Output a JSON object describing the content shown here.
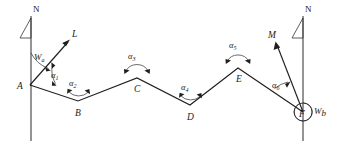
{
  "figure": {
    "background_color": "#ffffff",
    "line_color": "#1f1f1f",
    "width": 345,
    "height": 145
  },
  "north_markers": [
    {
      "id": "north-left",
      "label": "N",
      "x": 33,
      "y": 8
    },
    {
      "id": "north-right",
      "label": "N",
      "x": 305,
      "y": 8
    }
  ],
  "meridians": [
    {
      "id": "meridian-left",
      "x": 31,
      "y_top": 16,
      "y_bottom": 141
    },
    {
      "id": "meridian-right",
      "x": 303,
      "y_top": 16,
      "y_bottom": 141
    }
  ],
  "stations": [
    {
      "id": "A",
      "label": "A",
      "x": 30,
      "y": 85,
      "label_x": 17,
      "label_y": 88
    },
    {
      "id": "B",
      "label": "B",
      "x": 78,
      "y": 101,
      "label_x": 75,
      "label_y": 114
    },
    {
      "id": "C",
      "label": "C",
      "x": 137,
      "y": 78,
      "label_x": 134,
      "label_y": 91
    },
    {
      "id": "D",
      "label": "D",
      "x": 190,
      "y": 105,
      "label_x": 187,
      "label_y": 118
    },
    {
      "id": "E",
      "label": "E",
      "x": 238,
      "y": 68,
      "label_x": 236,
      "label_y": 81
    },
    {
      "id": "F",
      "label": "F",
      "x": 303,
      "y": 112,
      "label_x": 299,
      "label_y": 118
    }
  ],
  "traverse_path": "A-B-C-D-E-F",
  "angles": [
    {
      "id": "alpha-1",
      "label": "α",
      "sub": "1",
      "label_x": 51,
      "label_y": 77,
      "vertex": "A",
      "arc_type": "small-right"
    },
    {
      "id": "alpha-2",
      "label": "α",
      "sub": "2",
      "label_x": 72,
      "label_y": 85,
      "vertex": "B",
      "arc_type": "double-arrow-under"
    },
    {
      "id": "alpha-3",
      "label": "α",
      "sub": "3",
      "label_x": 131,
      "label_y": 58,
      "vertex": "C",
      "arc_type": "double-arrow-over"
    },
    {
      "id": "alpha-4",
      "label": "α",
      "sub": "4",
      "label_x": 184,
      "label_y": 89,
      "vertex": "D",
      "arc_type": "double-arrow-under"
    },
    {
      "id": "alpha-5",
      "label": "α",
      "sub": "5",
      "label_x": 232,
      "label_y": 47,
      "vertex": "E",
      "arc_type": "double-arrow-over"
    },
    {
      "id": "alpha-6",
      "label": "α",
      "sub": "6",
      "label_x": 277,
      "label_y": 87,
      "vertex": "F",
      "arc_type": "small-left"
    }
  ],
  "bearing_labels": [
    {
      "id": "w-a",
      "label": "W",
      "sub": "a",
      "x": 36,
      "y": 58,
      "station": "A"
    },
    {
      "id": "w-b",
      "label": "W",
      "sub": "b",
      "x": 316,
      "y": 112,
      "station": "F"
    }
  ],
  "rays": [
    {
      "id": "ray-L",
      "label": "L",
      "from_x": 30,
      "from_y": 85,
      "to_x": 70,
      "to_y": 40,
      "label_x": 73,
      "label_y": 36
    },
    {
      "id": "ray-M",
      "label": "M",
      "from_x": 303,
      "from_y": 112,
      "to_x": 275,
      "to_y": 42,
      "label_x": 277,
      "label_y": 38
    }
  ],
  "station-circle": {
    "id": "f-circle",
    "cx": 303,
    "cy": 112,
    "r": 9
  }
}
